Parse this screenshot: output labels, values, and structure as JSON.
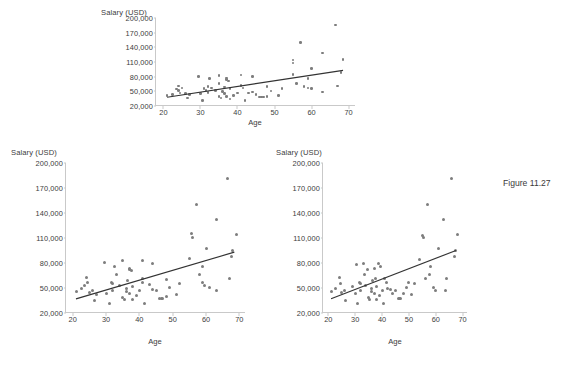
{
  "figure": {
    "caption": "Figure 11.27",
    "caption_x": 503,
    "caption_y": 178
  },
  "style": {
    "marker_color": "#7d7d7d",
    "trend_color": "#333333",
    "axis_color": "#c9c9c9",
    "text_color": "#3d3d3d",
    "background": "#ffffff"
  },
  "chart_data": [
    {
      "id": "top",
      "type": "scatter",
      "title": "",
      "xlabel": "Age",
      "ylabel": "Salary (USD)",
      "xlim": [
        18,
        72
      ],
      "ylim": [
        20000,
        200000
      ],
      "xticks": [
        20,
        30,
        40,
        50,
        60,
        70
      ],
      "xtick_labels": [
        "20",
        "30",
        "40",
        "50",
        "60",
        "70"
      ],
      "yticks": [
        20000,
        50000,
        80000,
        110000,
        140000,
        170000,
        200000
      ],
      "ytick_labels": [
        "20,000",
        "50,000",
        "80,000",
        "110,000",
        "140,000",
        "170,000",
        "200,000"
      ],
      "grid": false,
      "legend": "none",
      "trendline": {
        "x0": 21,
        "y0": 38000,
        "x1": 68.5,
        "y1": 93000
      },
      "points": [
        [
          21,
          41000
        ],
        [
          22.5,
          44000
        ],
        [
          23.5,
          55000
        ],
        [
          24,
          61000
        ],
        [
          24,
          52000
        ],
        [
          24.5,
          47000
        ],
        [
          25,
          57000
        ],
        [
          26,
          46000
        ],
        [
          26.5,
          36000
        ],
        [
          27,
          43000
        ],
        [
          29.5,
          80000
        ],
        [
          30,
          46000
        ],
        [
          30.5,
          31000
        ],
        [
          31,
          56000
        ],
        [
          31.5,
          52000
        ],
        [
          32,
          60000
        ],
        [
          32,
          48000
        ],
        [
          32.5,
          76000
        ],
        [
          33,
          57000
        ],
        [
          34,
          52000
        ],
        [
          35,
          82000
        ],
        [
          35,
          66000
        ],
        [
          35,
          40000
        ],
        [
          35.5,
          36000
        ],
        [
          36,
          50000
        ],
        [
          36.5,
          59000
        ],
        [
          36.5,
          45000
        ],
        [
          37,
          77000
        ],
        [
          37,
          74000
        ],
        [
          37,
          39000
        ],
        [
          37.5,
          71000
        ],
        [
          38,
          56000
        ],
        [
          38,
          34000
        ],
        [
          39,
          42000
        ],
        [
          40,
          47000
        ],
        [
          41,
          83000
        ],
        [
          41,
          62000
        ],
        [
          41.5,
          57000
        ],
        [
          42,
          31000
        ],
        [
          43,
          47000
        ],
        [
          44,
          80000
        ],
        [
          44,
          49000
        ],
        [
          45,
          44000
        ],
        [
          46,
          38000
        ],
        [
          46.5,
          38000
        ],
        [
          47,
          38000
        ],
        [
          48,
          60000
        ],
        [
          48,
          39000
        ],
        [
          49,
          51000
        ],
        [
          51,
          42000
        ],
        [
          52,
          56000
        ],
        [
          55,
          114000
        ],
        [
          55,
          108000
        ],
        [
          55,
          84000
        ],
        [
          56,
          66000
        ],
        [
          57,
          150000
        ],
        [
          58,
          60000
        ],
        [
          59,
          76000
        ],
        [
          59,
          57000
        ],
        [
          60,
          97000
        ],
        [
          60,
          56000
        ],
        [
          63,
          128000
        ],
        [
          63,
          49000
        ],
        [
          66.5,
          186000
        ],
        [
          67,
          61000
        ],
        [
          68,
          88000
        ],
        [
          68.5,
          115000
        ]
      ]
    },
    {
      "id": "bottom-left",
      "type": "scatter",
      "title": "",
      "xlabel": "Age",
      "ylabel": "Salary (USD)",
      "xlim": [
        18,
        72
      ],
      "ylim": [
        20000,
        200000
      ],
      "xticks": [
        20,
        30,
        40,
        50,
        60,
        70
      ],
      "xtick_labels": [
        "20",
        "30",
        "40",
        "50",
        "60",
        "70"
      ],
      "yticks": [
        20000,
        50000,
        80000,
        110000,
        140000,
        170000,
        200000
      ],
      "ytick_labels": [
        "20,000",
        "50,000",
        "80,000",
        "110,000",
        "140,000",
        "170,000",
        "200,000"
      ],
      "grid": false,
      "legend": "none",
      "trendline": {
        "x0": 21,
        "y0": 37000,
        "x1": 68.5,
        "y1": 93000
      },
      "points": [
        [
          21,
          46000
        ],
        [
          22.5,
          50000
        ],
        [
          23.5,
          53000
        ],
        [
          24,
          63000
        ],
        [
          24.5,
          57000
        ],
        [
          25,
          45000
        ],
        [
          26,
          47000
        ],
        [
          26.5,
          35000
        ],
        [
          27,
          42000
        ],
        [
          29.5,
          81000
        ],
        [
          30,
          44000
        ],
        [
          31,
          31000
        ],
        [
          31.5,
          57000
        ],
        [
          32,
          56000
        ],
        [
          32,
          47000
        ],
        [
          32.5,
          76000
        ],
        [
          33,
          66000
        ],
        [
          34,
          53000
        ],
        [
          35,
          83000
        ],
        [
          35,
          39000
        ],
        [
          35.5,
          36000
        ],
        [
          36,
          50000
        ],
        [
          36,
          46000
        ],
        [
          36.5,
          59000
        ],
        [
          37,
          74000
        ],
        [
          37,
          72000
        ],
        [
          37,
          43000
        ],
        [
          37.5,
          71000
        ],
        [
          38,
          52000
        ],
        [
          38,
          36000
        ],
        [
          39,
          41000
        ],
        [
          40,
          47000
        ],
        [
          41,
          83000
        ],
        [
          41,
          62000
        ],
        [
          41,
          57000
        ],
        [
          41.5,
          31000
        ],
        [
          43,
          54000
        ],
        [
          44,
          80000
        ],
        [
          44,
          48000
        ],
        [
          45,
          47000
        ],
        [
          46,
          38000
        ],
        [
          46.5,
          38000
        ],
        [
          47,
          38000
        ],
        [
          48,
          60000
        ],
        [
          48,
          40000
        ],
        [
          49,
          51000
        ],
        [
          51,
          42000
        ],
        [
          52,
          56000
        ],
        [
          55,
          85000
        ],
        [
          55.5,
          115000
        ],
        [
          56,
          111000
        ],
        [
          57,
          150000
        ],
        [
          58,
          66000
        ],
        [
          59,
          76000
        ],
        [
          59,
          57000
        ],
        [
          59.5,
          53000
        ],
        [
          60,
          98000
        ],
        [
          61,
          51000
        ],
        [
          63,
          132000
        ],
        [
          63,
          47000
        ],
        [
          66.5,
          182000
        ],
        [
          67,
          61000
        ],
        [
          67.5,
          88000
        ],
        [
          68,
          95000
        ],
        [
          69,
          114000
        ]
      ]
    },
    {
      "id": "bottom-right",
      "type": "scatter",
      "title": "",
      "xlabel": "Age",
      "ylabel": "Salary (USD)",
      "xlim": [
        18,
        72
      ],
      "ylim": [
        20000,
        200000
      ],
      "xticks": [
        20,
        30,
        40,
        50,
        60,
        70
      ],
      "xtick_labels": [
        "20",
        "30",
        "40",
        "50",
        "60",
        "70"
      ],
      "yticks": [
        20000,
        50000,
        80000,
        110000,
        140000,
        170000,
        200000
      ],
      "ytick_labels": [
        "20,000",
        "50,000",
        "80,000",
        "110,000",
        "140,000",
        "170,000",
        "200,000"
      ],
      "grid": false,
      "legend": "none",
      "trendline": {
        "x0": 21,
        "y0": 37000,
        "x1": 67.5,
        "y1": 95000
      },
      "points": [
        [
          21,
          46000
        ],
        [
          22.5,
          50000
        ],
        [
          24,
          63000
        ],
        [
          24.5,
          56000
        ],
        [
          25,
          45000
        ],
        [
          26,
          47000
        ],
        [
          26.5,
          35000
        ],
        [
          29,
          52000
        ],
        [
          30,
          44000
        ],
        [
          30.5,
          78000
        ],
        [
          31,
          31000
        ],
        [
          31.5,
          57000
        ],
        [
          32,
          56000
        ],
        [
          32,
          47000
        ],
        [
          33,
          80000
        ],
        [
          33.5,
          66000
        ],
        [
          34,
          53000
        ],
        [
          34.5,
          72000
        ],
        [
          35,
          39000
        ],
        [
          35.5,
          36000
        ],
        [
          36,
          50000
        ],
        [
          36,
          46000
        ],
        [
          36.5,
          59000
        ],
        [
          37,
          74000
        ],
        [
          37,
          43000
        ],
        [
          37.5,
          62000
        ],
        [
          38,
          52000
        ],
        [
          38,
          36000
        ],
        [
          38.5,
          80000
        ],
        [
          39,
          41000
        ],
        [
          39.5,
          76000
        ],
        [
          40,
          47000
        ],
        [
          40.5,
          31000
        ],
        [
          41,
          62000
        ],
        [
          41.5,
          57000
        ],
        [
          42,
          50000
        ],
        [
          43,
          48000
        ],
        [
          44,
          43000
        ],
        [
          45,
          47000
        ],
        [
          46,
          38000
        ],
        [
          46.5,
          38000
        ],
        [
          47,
          38000
        ],
        [
          48,
          44000
        ],
        [
          49,
          51000
        ],
        [
          50,
          57000
        ],
        [
          51,
          42000
        ],
        [
          52,
          56000
        ],
        [
          54,
          84000
        ],
        [
          55,
          113000
        ],
        [
          55.5,
          111000
        ],
        [
          56,
          61000
        ],
        [
          57,
          150000
        ],
        [
          57.5,
          66000
        ],
        [
          58,
          76000
        ],
        [
          59,
          51000
        ],
        [
          60,
          47000
        ],
        [
          61,
          98000
        ],
        [
          63,
          132000
        ],
        [
          63.5,
          47000
        ],
        [
          64,
          61000
        ],
        [
          66,
          182000
        ],
        [
          67,
          88000
        ],
        [
          67.5,
          95000
        ],
        [
          68,
          114000
        ]
      ]
    }
  ],
  "panels": [
    {
      "id": "top",
      "left": 155,
      "top": 18,
      "width": 200,
      "height": 88,
      "ylabel_x": 101,
      "ylabel_y": 8,
      "xlabel_cx": 255,
      "xlabel_y": 118
    },
    {
      "id": "bottom-left",
      "left": 65,
      "top": 163,
      "width": 180,
      "height": 150,
      "ylabel_x": 11,
      "ylabel_y": 148,
      "xlabel_cx": 155,
      "xlabel_y": 337
    },
    {
      "id": "bottom-right",
      "left": 322,
      "top": 163,
      "width": 145,
      "height": 150,
      "ylabel_x": 276,
      "ylabel_y": 148,
      "xlabel_cx": 395,
      "xlabel_y": 337
    }
  ]
}
